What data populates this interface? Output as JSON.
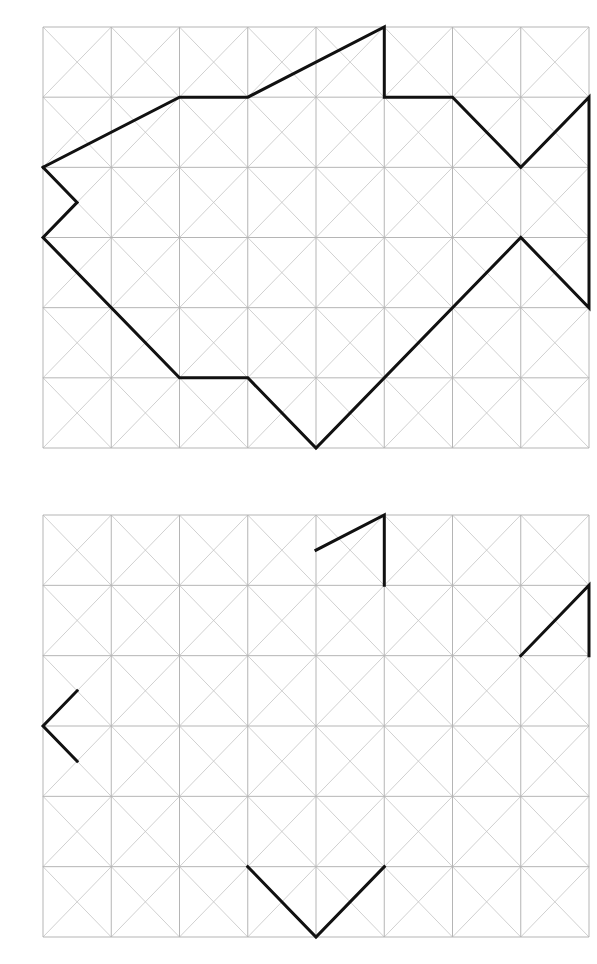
{
  "page": {
    "background": "#ffffff"
  },
  "style": {
    "grid_color": "#b5b5b5",
    "grid_width": 1,
    "diag_color": "#c4c4c4",
    "diag_width": 0.8,
    "shape_color": "#111111",
    "shape_width": 3
  },
  "grids": [
    {
      "name": "model-grid",
      "x": 43,
      "y": 27,
      "width": 546,
      "height": 421,
      "cols": 8,
      "rows": 6,
      "cell_diagonals": true,
      "shape_kind": "closed-polyline",
      "paths": [
        [
          [
            0,
            2
          ],
          [
            2,
            1
          ],
          [
            3,
            1
          ],
          [
            5,
            0
          ],
          [
            5,
            1
          ],
          [
            6,
            1
          ],
          [
            7,
            2
          ],
          [
            8,
            1
          ],
          [
            8,
            4
          ],
          [
            7,
            3
          ],
          [
            4,
            6
          ],
          [
            3,
            5
          ],
          [
            2,
            5
          ],
          [
            0,
            3
          ],
          [
            0.5,
            2.5
          ],
          [
            0,
            2
          ]
        ]
      ]
    },
    {
      "name": "copy-grid",
      "x": 43,
      "y": 515,
      "width": 546,
      "height": 422,
      "cols": 8,
      "rows": 6,
      "cell_diagonals": true,
      "shape_kind": "partial-segments",
      "paths": [
        [
          [
            4,
            0.5
          ],
          [
            5,
            0
          ],
          [
            5,
            1
          ]
        ],
        [
          [
            7,
            2
          ],
          [
            8,
            1
          ],
          [
            8,
            2
          ]
        ],
        [
          [
            0.5,
            2.5
          ],
          [
            0,
            3
          ],
          [
            0.5,
            3.5
          ]
        ],
        [
          [
            3,
            5
          ],
          [
            4,
            6
          ],
          [
            5,
            5
          ]
        ]
      ]
    }
  ]
}
